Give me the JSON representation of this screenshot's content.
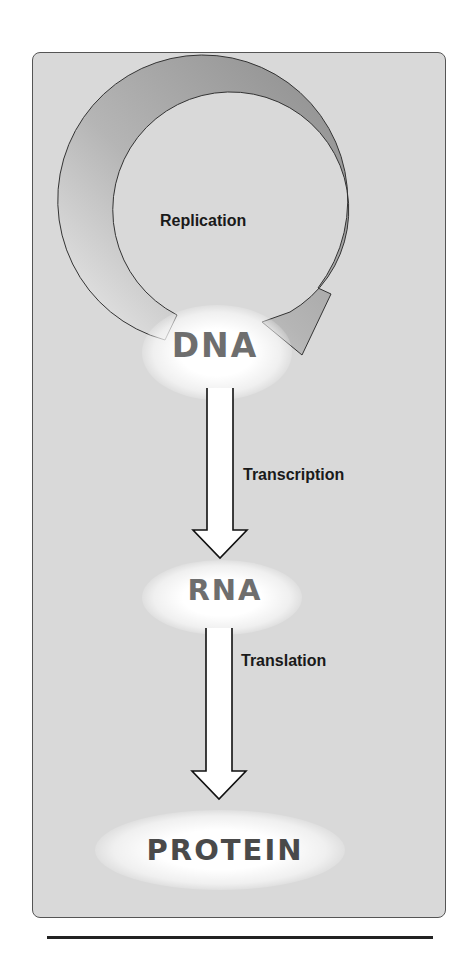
{
  "diagram": {
    "nodes": [
      {
        "id": "dna",
        "label": "DNA"
      },
      {
        "id": "rna",
        "label": "RNA"
      },
      {
        "id": "protein",
        "label": "PROTEIN"
      }
    ],
    "edges": [
      {
        "from": "dna",
        "to": "dna",
        "label": "Replication",
        "style": "circular-arrow"
      },
      {
        "from": "dna",
        "to": "rna",
        "label": "Transcription",
        "style": "hollow-down-arrow"
      },
      {
        "from": "rna",
        "to": "protein",
        "label": "Translation",
        "style": "hollow-down-arrow"
      }
    ],
    "colors": {
      "panel_bg": "#d9d9d9",
      "node_text": "#6e6e6e",
      "label_text": "#1a1a1a",
      "arc_light": "#f0f0f0",
      "arc_dark": "#8a8a8a"
    }
  }
}
